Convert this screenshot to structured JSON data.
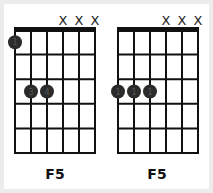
{
  "diagrams": [
    {
      "name": "F5",
      "label": "F5",
      "origin_x": 15,
      "strings": 6,
      "frets": 5,
      "muted_strings": [
        4,
        5,
        6
      ],
      "muted_symbol": "X",
      "dots": [
        {
          "string": 1,
          "fret": 1,
          "finger": "1"
        },
        {
          "string": 2,
          "fret": 3,
          "finger": "3"
        },
        {
          "string": 3,
          "fret": 3,
          "finger": "4"
        }
      ]
    },
    {
      "name": "F5",
      "label": "F5",
      "origin_x": 118,
      "strings": 6,
      "frets": 5,
      "muted_strings": [
        4,
        5,
        6
      ],
      "muted_symbol": "X",
      "dots": [
        {
          "string": 1,
          "fret": 3,
          "finger": "1"
        },
        {
          "string": 2,
          "fret": 3,
          "finger": "1"
        },
        {
          "string": 3,
          "fret": 3,
          "finger": "1"
        }
      ]
    }
  ],
  "colors": {
    "grid": "#111111",
    "dot": "#2b2b2b",
    "finger_text": "#555555",
    "background": "#ffffff",
    "frame": "#ececec"
  }
}
